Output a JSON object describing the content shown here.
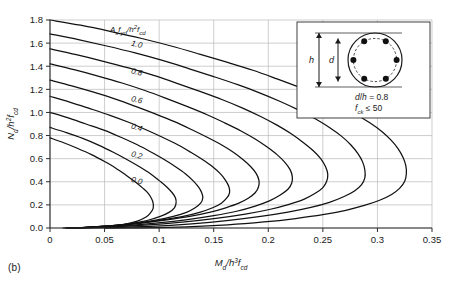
{
  "figure": {
    "caption": "(b)",
    "background": "#ffffff"
  },
  "chart_data": {
    "type": "line",
    "title": "",
    "subtitle": "",
    "xlabel": "M_d/h^3 f_cd",
    "ylabel": "N_d/h^2 f_cd",
    "xlabel_parts": {
      "num": "M",
      "num_sub": "d",
      "den": "h",
      "den_exp": "3",
      "den2": "f",
      "den2_sub": "cd"
    },
    "ylabel_parts": {
      "num": "N",
      "num_sub": "d",
      "den": "h",
      "den_exp": "2",
      "den2": "f",
      "den2_sub": "cd"
    },
    "xlim": [
      0,
      0.35
    ],
    "ylim": [
      0,
      1.8
    ],
    "xticks": [
      "0",
      "0.05",
      "0.1",
      "0.15",
      "0.2",
      "0.25",
      "0.3",
      "0.35"
    ],
    "xtick_values": [
      0,
      0.05,
      0.1,
      0.15,
      0.2,
      0.25,
      0.3,
      0.35
    ],
    "yticks": [
      "0.0",
      "0.2",
      "0.4",
      "0.6",
      "0.8",
      "1.0",
      "1.2",
      "1.4",
      "1.6",
      "1.8"
    ],
    "ytick_values": [
      0.0,
      0.2,
      0.4,
      0.6,
      0.8,
      1.0,
      1.2,
      1.4,
      1.6,
      1.8
    ],
    "grid": true,
    "legend_position": "inline-labels",
    "series_parameter_label": "As fyd / h² fcd",
    "series_parameter_label_parts": {
      "a": "A",
      "a_sub": "s",
      "b": "f",
      "b_sub": "yd",
      "c": "h",
      "c_exp": "2",
      "d": "f",
      "d_sub": "cd"
    },
    "curve_labels": [
      "1.0",
      "0.8",
      "0.6",
      "0.4",
      "0.2",
      "0.0"
    ],
    "curve_color": "#111111",
    "grid_color": "#b9b9b9",
    "axis_color": "#2b2b2b",
    "series": [
      {
        "name": "0.0",
        "points": [
          [
            0,
            0.78
          ],
          [
            0.012,
            0.74
          ],
          [
            0.025,
            0.69
          ],
          [
            0.038,
            0.635
          ],
          [
            0.05,
            0.575
          ],
          [
            0.06,
            0.52
          ],
          [
            0.07,
            0.455
          ],
          [
            0.078,
            0.4
          ],
          [
            0.085,
            0.345
          ],
          [
            0.09,
            0.3
          ],
          [
            0.093,
            0.255
          ],
          [
            0.0945,
            0.215
          ],
          [
            0.0945,
            0.17
          ],
          [
            0.092,
            0.13
          ],
          [
            0.088,
            0.095
          ],
          [
            0.08,
            0.06
          ],
          [
            0.068,
            0.032
          ],
          [
            0.05,
            0.012
          ],
          [
            0.03,
            0.003
          ],
          [
            0.012,
            0.0
          ]
        ]
      },
      {
        "name": "0.1",
        "points": [
          [
            0,
            0.87
          ],
          [
            0.015,
            0.825
          ],
          [
            0.03,
            0.775
          ],
          [
            0.045,
            0.715
          ],
          [
            0.058,
            0.655
          ],
          [
            0.07,
            0.595
          ],
          [
            0.082,
            0.53
          ],
          [
            0.092,
            0.47
          ],
          [
            0.1,
            0.41
          ],
          [
            0.107,
            0.355
          ],
          [
            0.112,
            0.305
          ],
          [
            0.115,
            0.26
          ],
          [
            0.1155,
            0.215
          ],
          [
            0.114,
            0.175
          ],
          [
            0.109,
            0.135
          ],
          [
            0.101,
            0.1
          ],
          [
            0.089,
            0.065
          ],
          [
            0.073,
            0.038
          ],
          [
            0.052,
            0.016
          ],
          [
            0.03,
            0.004
          ],
          [
            0.014,
            0.0
          ]
        ]
      },
      {
        "name": "0.2",
        "points": [
          [
            0,
            1.0
          ],
          [
            0.016,
            0.955
          ],
          [
            0.033,
            0.9
          ],
          [
            0.05,
            0.845
          ],
          [
            0.065,
            0.785
          ],
          [
            0.08,
            0.72
          ],
          [
            0.093,
            0.655
          ],
          [
            0.105,
            0.59
          ],
          [
            0.115,
            0.53
          ],
          [
            0.124,
            0.47
          ],
          [
            0.131,
            0.41
          ],
          [
            0.136,
            0.355
          ],
          [
            0.139,
            0.305
          ],
          [
            0.14,
            0.26
          ],
          [
            0.138,
            0.215
          ],
          [
            0.133,
            0.175
          ],
          [
            0.125,
            0.135
          ],
          [
            0.113,
            0.1
          ],
          [
            0.097,
            0.068
          ],
          [
            0.077,
            0.04
          ],
          [
            0.054,
            0.018
          ],
          [
            0.031,
            0.005
          ],
          [
            0.015,
            0.0
          ]
        ]
      },
      {
        "name": "0.3",
        "points": [
          [
            0,
            1.14
          ],
          [
            0.018,
            1.09
          ],
          [
            0.036,
            1.035
          ],
          [
            0.055,
            0.975
          ],
          [
            0.072,
            0.915
          ],
          [
            0.088,
            0.85
          ],
          [
            0.103,
            0.785
          ],
          [
            0.117,
            0.72
          ],
          [
            0.129,
            0.655
          ],
          [
            0.14,
            0.59
          ],
          [
            0.149,
            0.53
          ],
          [
            0.156,
            0.47
          ],
          [
            0.161,
            0.41
          ],
          [
            0.164,
            0.355
          ],
          [
            0.1645,
            0.305
          ],
          [
            0.162,
            0.26
          ],
          [
            0.157,
            0.215
          ],
          [
            0.149,
            0.175
          ],
          [
            0.137,
            0.135
          ],
          [
            0.122,
            0.1
          ],
          [
            0.103,
            0.07
          ],
          [
            0.081,
            0.042
          ],
          [
            0.057,
            0.02
          ],
          [
            0.033,
            0.006
          ],
          [
            0.016,
            0.0
          ]
        ]
      },
      {
        "name": "0.4",
        "points": [
          [
            0,
            1.28
          ],
          [
            0.02,
            1.23
          ],
          [
            0.04,
            1.175
          ],
          [
            0.06,
            1.115
          ],
          [
            0.079,
            1.05
          ],
          [
            0.097,
            0.985
          ],
          [
            0.114,
            0.92
          ],
          [
            0.13,
            0.85
          ],
          [
            0.144,
            0.785
          ],
          [
            0.157,
            0.72
          ],
          [
            0.168,
            0.655
          ],
          [
            0.177,
            0.59
          ],
          [
            0.184,
            0.53
          ],
          [
            0.189,
            0.47
          ],
          [
            0.1915,
            0.41
          ],
          [
            0.191,
            0.355
          ],
          [
            0.188,
            0.305
          ],
          [
            0.182,
            0.26
          ],
          [
            0.173,
            0.215
          ],
          [
            0.161,
            0.175
          ],
          [
            0.146,
            0.135
          ],
          [
            0.128,
            0.1
          ],
          [
            0.107,
            0.07
          ],
          [
            0.084,
            0.043
          ],
          [
            0.059,
            0.021
          ],
          [
            0.034,
            0.006
          ],
          [
            0.017,
            0.0
          ]
        ]
      },
      {
        "name": "0.5",
        "points": [
          [
            0,
            1.42
          ],
          [
            0.022,
            1.37
          ],
          [
            0.044,
            1.315
          ],
          [
            0.066,
            1.255
          ],
          [
            0.087,
            1.19
          ],
          [
            0.107,
            1.12
          ],
          [
            0.126,
            1.05
          ],
          [
            0.144,
            0.98
          ],
          [
            0.16,
            0.91
          ],
          [
            0.175,
            0.84
          ],
          [
            0.188,
            0.77
          ],
          [
            0.199,
            0.7
          ],
          [
            0.208,
            0.635
          ],
          [
            0.215,
            0.57
          ],
          [
            0.22,
            0.505
          ],
          [
            0.222,
            0.445
          ],
          [
            0.2215,
            0.39
          ],
          [
            0.218,
            0.335
          ],
          [
            0.211,
            0.285
          ],
          [
            0.201,
            0.235
          ],
          [
            0.188,
            0.19
          ],
          [
            0.171,
            0.145
          ],
          [
            0.15,
            0.107
          ],
          [
            0.126,
            0.073
          ],
          [
            0.099,
            0.044
          ],
          [
            0.07,
            0.021
          ],
          [
            0.04,
            0.006
          ],
          [
            0.019,
            0.0
          ]
        ]
      },
      {
        "name": "0.6",
        "points": [
          [
            0,
            1.55
          ],
          [
            0.024,
            1.5
          ],
          [
            0.048,
            1.445
          ],
          [
            0.072,
            1.385
          ],
          [
            0.095,
            1.32
          ],
          [
            0.117,
            1.25
          ],
          [
            0.138,
            1.18
          ],
          [
            0.158,
            1.11
          ],
          [
            0.176,
            1.04
          ],
          [
            0.193,
            0.965
          ],
          [
            0.208,
            0.89
          ],
          [
            0.221,
            0.815
          ],
          [
            0.232,
            0.74
          ],
          [
            0.241,
            0.67
          ],
          [
            0.248,
            0.6
          ],
          [
            0.2525,
            0.53
          ],
          [
            0.2545,
            0.465
          ],
          [
            0.2535,
            0.405
          ],
          [
            0.25,
            0.35
          ],
          [
            0.243,
            0.3
          ],
          [
            0.233,
            0.25
          ],
          [
            0.219,
            0.205
          ],
          [
            0.201,
            0.16
          ],
          [
            0.179,
            0.12
          ],
          [
            0.152,
            0.083
          ],
          [
            0.121,
            0.05
          ],
          [
            0.087,
            0.024
          ],
          [
            0.05,
            0.007
          ],
          [
            0.022,
            0.0
          ]
        ]
      },
      {
        "name": "0.7",
        "points": [
          [
            0,
            1.68
          ],
          [
            0.026,
            1.63
          ],
          [
            0.052,
            1.575
          ],
          [
            0.078,
            1.515
          ],
          [
            0.103,
            1.45
          ],
          [
            0.127,
            1.38
          ],
          [
            0.15,
            1.31
          ],
          [
            0.172,
            1.24
          ],
          [
            0.192,
            1.17
          ],
          [
            0.211,
            1.095
          ],
          [
            0.228,
            1.02
          ],
          [
            0.243,
            0.945
          ],
          [
            0.256,
            0.87
          ],
          [
            0.267,
            0.795
          ],
          [
            0.2755,
            0.72
          ],
          [
            0.282,
            0.645
          ],
          [
            0.2865,
            0.57
          ],
          [
            0.2885,
            0.5
          ],
          [
            0.2885,
            0.435
          ],
          [
            0.2855,
            0.375
          ],
          [
            0.279,
            0.32
          ],
          [
            0.269,
            0.27
          ],
          [
            0.256,
            0.222
          ],
          [
            0.239,
            0.178
          ],
          [
            0.218,
            0.137
          ],
          [
            0.193,
            0.1
          ],
          [
            0.164,
            0.066
          ],
          [
            0.13,
            0.036
          ],
          [
            0.092,
            0.014
          ],
          [
            0.052,
            0.003
          ],
          [
            0.024,
            0.0
          ]
        ]
      },
      {
        "name": "0.8",
        "points": [
          [
            0,
            1.8
          ],
          [
            0.028,
            1.755
          ],
          [
            0.056,
            1.7
          ],
          [
            0.084,
            1.64
          ],
          [
            0.111,
            1.575
          ],
          [
            0.137,
            1.505
          ],
          [
            0.162,
            1.435
          ],
          [
            0.186,
            1.365
          ],
          [
            0.208,
            1.29
          ],
          [
            0.229,
            1.215
          ],
          [
            0.248,
            1.14
          ],
          [
            0.265,
            1.06
          ],
          [
            0.28,
            0.985
          ],
          [
            0.293,
            0.91
          ],
          [
            0.304,
            0.835
          ],
          [
            0.3125,
            0.76
          ],
          [
            0.319,
            0.685
          ],
          [
            0.3235,
            0.61
          ],
          [
            0.326,
            0.54
          ],
          [
            0.3265,
            0.47
          ],
          [
            0.325,
            0.405
          ],
          [
            0.3205,
            0.345
          ],
          [
            0.313,
            0.29
          ],
          [
            0.302,
            0.24
          ],
          [
            0.288,
            0.195
          ],
          [
            0.271,
            0.153
          ],
          [
            0.25,
            0.115
          ],
          [
            0.225,
            0.082
          ],
          [
            0.196,
            0.052
          ],
          [
            0.163,
            0.027
          ],
          [
            0.125,
            0.01
          ],
          [
            0.085,
            0.002
          ],
          [
            0.05,
            0.0
          ]
        ]
      }
    ],
    "annotation_curve_labels": [
      {
        "text": "1.0",
        "x": 0.074,
        "y": 1.58
      },
      {
        "text": "0.8",
        "x": 0.074,
        "y": 1.34
      },
      {
        "text": "0.6",
        "x": 0.074,
        "y": 1.1
      },
      {
        "text": "0.4",
        "x": 0.074,
        "y": 0.86
      },
      {
        "text": "0.2",
        "x": 0.074,
        "y": 0.62
      },
      {
        "text": "0.0",
        "x": 0.074,
        "y": 0.4
      }
    ]
  },
  "inset": {
    "name": "circular-column-cross-section",
    "dimension_h": "h",
    "dimension_d": "d",
    "note_ratio": "d/h = 0.8",
    "note_ratio_parts": {
      "d": "d",
      "h": "h",
      "value": "= 0.8"
    },
    "note_strength": "f_ck ≤ 50",
    "note_strength_parts": {
      "f": "f",
      "sub": "ck",
      "rest": "≤ 50"
    },
    "rebar_count": 6,
    "rebar_color": "#111111"
  }
}
